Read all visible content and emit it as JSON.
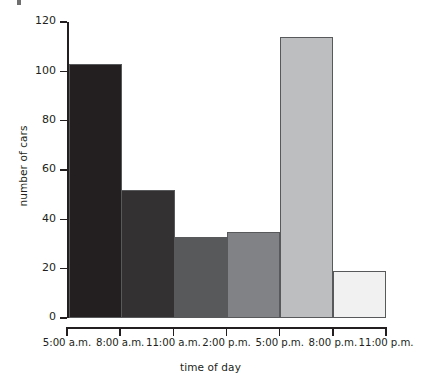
{
  "chart_data": {
    "type": "bar",
    "title": "",
    "subtitle": "",
    "xlabel": "time of day",
    "ylabel": "number of cars",
    "categories": [
      "5:00 a.m. - 8:00 a.m.",
      "8:00 a.m. - 11:00 a.m.",
      "11:00 a.m. - 2:00 p.m.",
      "2:00 p.m. - 5:00 p.m.",
      "5:00 p.m. - 8:00 p.m.",
      "8:00 p.m. - 11:00 p.m."
    ],
    "values": [
      103,
      52,
      33,
      35,
      114,
      19
    ],
    "bar_colors": [
      "#231f20",
      "#333132",
      "#58595b",
      "#808285",
      "#bcbec0",
      "#f1f1f2"
    ],
    "bar_edge_color": "#58595b",
    "ylim": [
      0,
      120
    ],
    "ytick_values": [
      0,
      20,
      40,
      60,
      80,
      100,
      120
    ],
    "ytick_labels": [
      "0",
      "20",
      "40",
      "60",
      "80",
      "100",
      "120"
    ],
    "xtick_labels": [
      "5:00 a.m.",
      "8:00 a.m.",
      "11:00 a.m.",
      "2:00 p.m.",
      "5:00 p.m.",
      "8:00 p.m.",
      "11:00 p.m."
    ],
    "grid": false,
    "legend": null,
    "legend_position": "none",
    "axis_color": "#231f20",
    "background_color": "#ffffff"
  }
}
